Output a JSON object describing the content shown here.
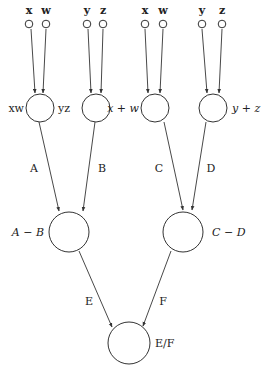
{
  "diagram": {
    "type": "computation-graph",
    "inputs": [
      {
        "id": "in1",
        "label": "x",
        "cx": 29,
        "label_x": 29
      },
      {
        "id": "in2",
        "label": "w",
        "cx": 46,
        "label_x": 46
      },
      {
        "id": "in3",
        "label": "y",
        "cx": 87,
        "label_x": 87
      },
      {
        "id": "in4",
        "label": "z",
        "cx": 103,
        "label_x": 103
      },
      {
        "id": "in5",
        "label": "x",
        "cx": 145,
        "label_x": 145
      },
      {
        "id": "in6",
        "label": "w",
        "cx": 163,
        "label_x": 163
      },
      {
        "id": "in7",
        "label": "y",
        "cx": 202,
        "label_x": 202
      },
      {
        "id": "in8",
        "label": "z",
        "cx": 222,
        "label_x": 222
      }
    ],
    "layer1": [
      {
        "id": "n_xw",
        "node_label": "xw",
        "edge_label": "A",
        "cx": 40,
        "label_side": "left",
        "italic": false
      },
      {
        "id": "n_yz",
        "node_label": "yz",
        "edge_label": "B",
        "cx": 96,
        "label_side": "left",
        "italic": false
      },
      {
        "id": "n_xpw",
        "node_label": "x + w",
        "edge_label": "C",
        "cx": 155,
        "label_side": "left",
        "italic": true
      },
      {
        "id": "n_ypz",
        "node_label": "y + z",
        "edge_label": "D",
        "cx": 213,
        "label_side": "right",
        "italic": true
      }
    ],
    "layer2": [
      {
        "id": "n_amb",
        "node_label": "A − B",
        "edge_label": "E",
        "cx": 80,
        "label_side": "left"
      },
      {
        "id": "n_cmd",
        "node_label": "C − D",
        "edge_label": "F",
        "cx": 184,
        "label_side": "right"
      }
    ],
    "output": {
      "id": "n_ef",
      "node_label": "E/F",
      "cx": 131
    },
    "edge_labels": {
      "A": "A",
      "B": "B",
      "C": "C",
      "D": "D",
      "E": "E",
      "F": "F"
    }
  }
}
